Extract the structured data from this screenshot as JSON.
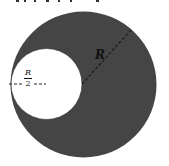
{
  "diagram": {
    "type": "disc-with-cavity",
    "outer_circle": {
      "label": "R",
      "fill": "#454545"
    },
    "cavity": {
      "label_numerator": "R",
      "label_denominator": "2",
      "fill": "#ffffff"
    },
    "line_color": "#222222"
  }
}
